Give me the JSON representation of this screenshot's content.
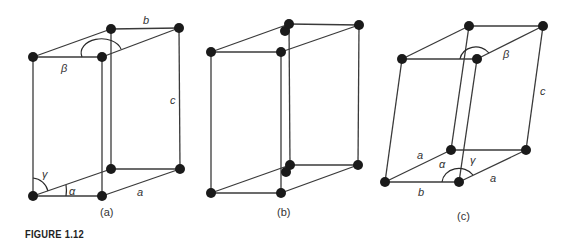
{
  "caption": "FIGURE 1.12",
  "panels": {
    "a": {
      "label": "(a)",
      "edge_labels": {
        "b": "b",
        "c": "c",
        "a": "a",
        "beta": "β",
        "gamma": "γ",
        "alpha": "α"
      }
    },
    "b": {
      "label": "(b)"
    },
    "c": {
      "label": "(c)",
      "edge_labels": {
        "a_left": "a",
        "a_right": "a",
        "b": "b",
        "c": "c",
        "beta": "β",
        "gamma": "γ",
        "alpha": "α"
      }
    }
  },
  "colors": {
    "line": "#3a3a3a",
    "node": "#1a1a1a",
    "text": "#333333"
  }
}
